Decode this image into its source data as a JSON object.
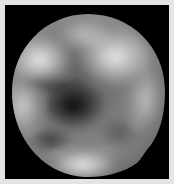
{
  "image": {
    "subject": "grayscale planetary body (sphere) on black background",
    "colors": {
      "frame": "#e4e4e4",
      "background": "#000000",
      "surface_base": "#7a7a7a",
      "highlight": "#e8e8e8",
      "shadow": "#141414"
    }
  }
}
